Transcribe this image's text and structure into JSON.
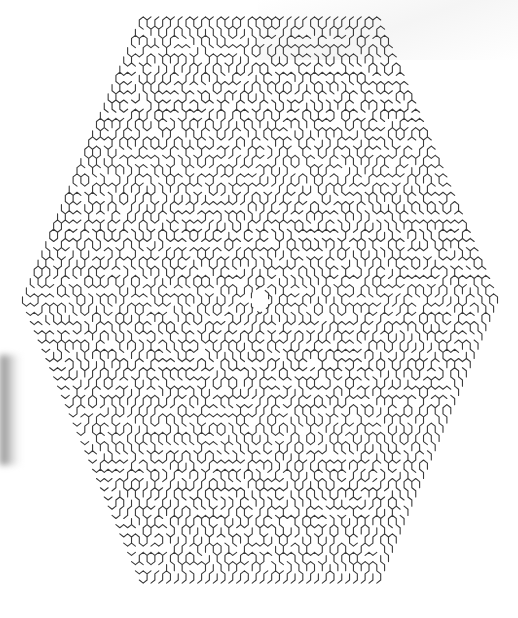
{
  "maze": {
    "shape": "hexagon",
    "cell_type": "hexagonal",
    "wall_color": "#3a3a3a",
    "background_color": "#ffffff",
    "center_open_cell": true,
    "vertices": {
      "top": [
        260,
        12
      ],
      "upper_right": [
        497,
        153
      ],
      "lower_right": [
        497,
        440
      ],
      "bottom": [
        260,
        578
      ],
      "lower_left": [
        22,
        440
      ],
      "upper_left": [
        22,
        153
      ]
    },
    "center": [
      260,
      300
    ],
    "hex_radius_cells": 30,
    "cell_size_px": 4.6,
    "wall_width_px": 1.1,
    "seed": 1337
  }
}
